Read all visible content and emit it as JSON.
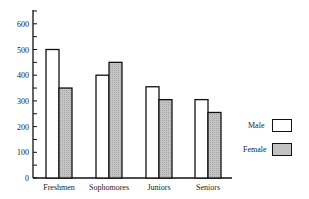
{
  "chart_data": {
    "type": "bar",
    "title": "",
    "xlabel": "",
    "ylabel": "",
    "ylim": [
      0,
      650
    ],
    "yticks": [
      0,
      100,
      200,
      300,
      400,
      500,
      600
    ],
    "categories": [
      "Freshmen",
      "Sophomores",
      "Juniors",
      "Seniors"
    ],
    "series": [
      {
        "name": "Male",
        "values": [
          500,
          400,
          355,
          305
        ],
        "color": "#ffffff"
      },
      {
        "name": "Female",
        "values": [
          350,
          450,
          305,
          255
        ],
        "color": "#c8c8c8"
      }
    ],
    "legend_position": "right",
    "grid": false
  },
  "legend": {
    "male_label": "Male",
    "female_label": "Female"
  }
}
